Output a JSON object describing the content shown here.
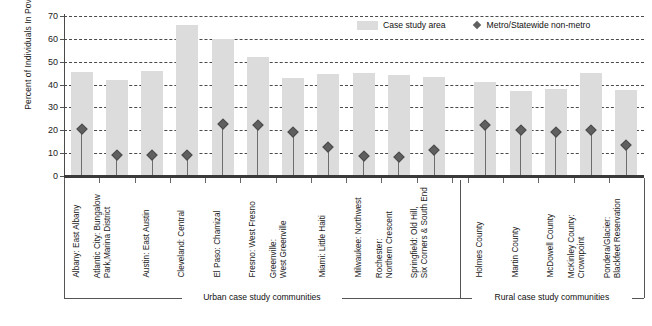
{
  "chart_data": {
    "type": "bar",
    "title": "",
    "xlabel": "",
    "ylabel": "Percent of Individuals In Poverty, 2000",
    "ylim": [
      0,
      70
    ],
    "yticks": [
      0,
      10,
      20,
      30,
      40,
      50,
      60,
      70
    ],
    "grid": true,
    "legend_position": "top-right",
    "legend": [
      {
        "name": "Case study area",
        "marker": "bar",
        "color": "#dcdcdc"
      },
      {
        "name": "Metro/Statewide non-metro",
        "marker": "diamond",
        "color": "#5f5f5f"
      }
    ],
    "categories": [
      "Albany: East Albany",
      "Atlantic City: Bungalow Park,Marina District",
      "Austin: East Austin",
      "Cleveland: Central",
      "El Paso: Chamizal",
      "Fresno: West Fresno",
      "Greenville: West Greenville",
      "Miami: Little Haiti",
      "Milwaukee: Northwest",
      "Rochester: Northern Crescent",
      "Springfield: Old Hill, Six Corners & South End",
      "Holmes County",
      "Martin County",
      "McDowell County",
      "McKinley County: Crownpoint",
      "Pondera/Glacier: Blackfeet Reservation"
    ],
    "category_lines": [
      [
        "Albany: East Albany"
      ],
      [
        "Atlantic City: Bungalow",
        "Park,Marina District"
      ],
      [
        "Austin: East Austin"
      ],
      [
        "Cleveland: Central"
      ],
      [
        "El Paso: Chamizal"
      ],
      [
        "Fresno: West Fresno"
      ],
      [
        "Greenville:",
        "West Greenville"
      ],
      [
        "Miami: Little Haiti"
      ],
      [
        "Milwaukee: Northwest"
      ],
      [
        "Rochester:",
        "Northern Crescent"
      ],
      [
        "Springfield: Old Hill,",
        "Six Corners & South End"
      ],
      [
        "Holmes County"
      ],
      [
        "Martin County"
      ],
      [
        "McDowell County"
      ],
      [
        "McKinley County:",
        "Crownpoint"
      ],
      [
        "Pondera/Glacier:",
        "Blackfeet Reservation"
      ]
    ],
    "series": [
      {
        "name": "Case study area",
        "values": [
          45.5,
          42.0,
          46.0,
          66.0,
          60.0,
          52.0,
          43.0,
          44.5,
          45.0,
          44.0,
          43.5,
          41.0,
          37.0,
          38.0,
          45.0,
          37.5
        ]
      },
      {
        "name": "Metro/Statewide non-metro",
        "values": [
          21.8,
          10.5,
          10.5,
          10.5,
          24.0,
          23.5,
          20.5,
          14.0,
          10.0,
          9.5,
          12.5,
          23.5,
          21.5,
          20.5,
          21.5,
          15.0
        ]
      }
    ],
    "groups": [
      {
        "label": "Urban case study communities",
        "start": 0,
        "end": 10
      },
      {
        "label": "Rural case study communities",
        "start": 11,
        "end": 15
      }
    ]
  }
}
